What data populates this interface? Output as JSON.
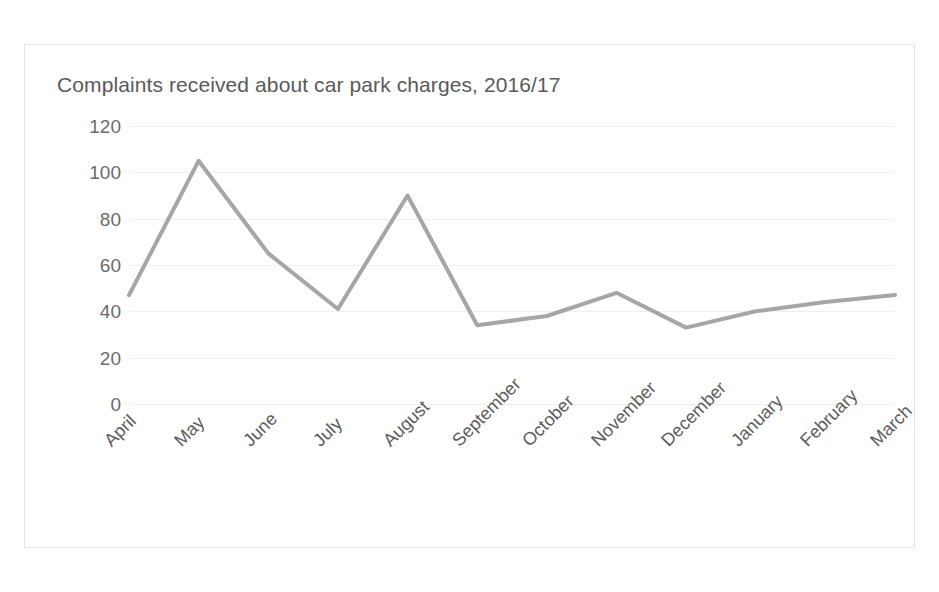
{
  "chart_data": {
    "type": "line",
    "title": "Complaints received about car park charges, 2016/17",
    "xlabel": "",
    "ylabel": "",
    "categories": [
      "April",
      "May",
      "June",
      "July",
      "August",
      "September",
      "October",
      "November",
      "December",
      "January",
      "February",
      "March"
    ],
    "values": [
      47,
      105,
      65,
      41,
      90,
      34,
      38,
      48,
      33,
      40,
      44,
      47
    ],
    "series": [
      {
        "name": "Complaints received",
        "values": [
          47,
          105,
          65,
          41,
          90,
          34,
          38,
          48,
          33,
          40,
          44,
          47
        ]
      }
    ],
    "ylim": [
      0,
      120
    ],
    "yticks": [
      0,
      20,
      40,
      60,
      80,
      100,
      120
    ],
    "ytick_labels": [
      "0",
      "20",
      "40",
      "60",
      "80",
      "100",
      "120"
    ],
    "grid": true,
    "grid_axis": "y",
    "legend": false,
    "legend_position": "none",
    "line_color": "#a6a6a6",
    "line_width": 4,
    "markers": false,
    "background_color": "#ffffff",
    "frame_color": "#e3e3e3",
    "gridline_color": "#f0f0f0",
    "title_color": "#5a5a5a",
    "tick_label_color": "#6b6b6b",
    "xtick_rotation": -45
  }
}
